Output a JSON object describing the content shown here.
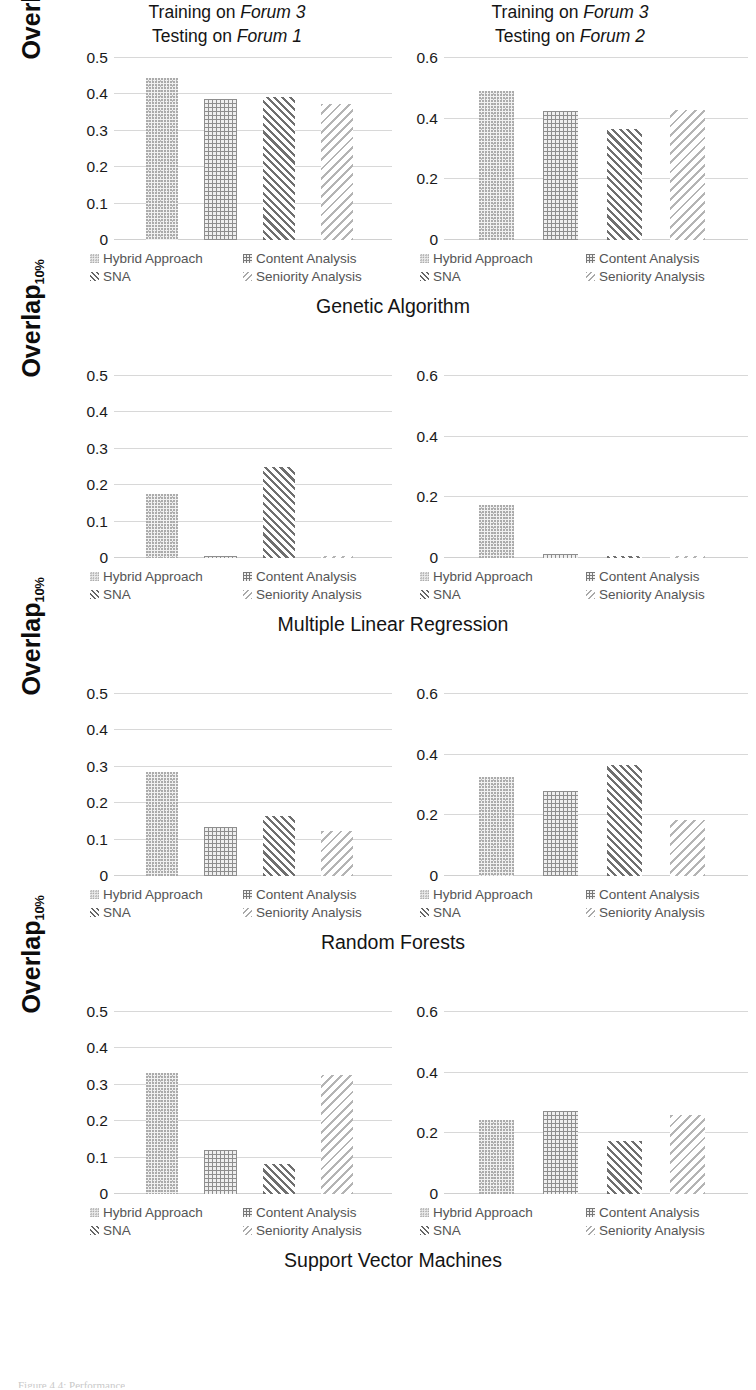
{
  "figure": {
    "ylabel_main": "Overlap",
    "ylabel_sub": "10%",
    "caption": "Figure 4.4: Performance"
  },
  "legend": {
    "hybrid": "Hybrid Approach",
    "content": "Content Analysis",
    "sna": "SNA",
    "seniority": "Seniority Analysis"
  },
  "titles": {
    "left_line1_pre": "Training on ",
    "left_line1_em": "Forum 3",
    "left_line2_pre": "Testing on ",
    "left_line2_em": "Forum 1",
    "right_line1_pre": "Training on ",
    "right_line1_em": "Forum 3",
    "right_line2_pre": "Testing on ",
    "right_line2_em": "Forum 2"
  },
  "ticks": {
    "left": [
      "0.5",
      "0.4",
      "0.3",
      "0.2",
      "0.1",
      "0"
    ],
    "right": [
      "0.6",
      "0.4",
      "0.2",
      "0"
    ]
  },
  "rows": [
    {
      "algorithm": "Genetic Algorithm"
    },
    {
      "algorithm": "Multiple Linear Regression"
    },
    {
      "algorithm": "Random Forests"
    },
    {
      "algorithm": "Support Vector Machines"
    }
  ],
  "chart_data": [
    {
      "type": "bar",
      "title": "Training on Forum 3 / Testing on Forum 1",
      "algorithm": "Genetic Algorithm",
      "xlabel": "Genetic Algorithm",
      "ylabel": "Overlap 10%",
      "ylim": [
        0,
        0.5
      ],
      "yticks": [
        0,
        0.1,
        0.2,
        0.3,
        0.4,
        0.5
      ],
      "grid": true,
      "legend_position": "bottom",
      "categories": [
        "Hybrid Approach",
        "Content Analysis",
        "SNA",
        "Seniority Analysis"
      ],
      "values": [
        0.445,
        0.388,
        0.392,
        0.375
      ]
    },
    {
      "type": "bar",
      "title": "Training on Forum 3 / Testing on Forum 2",
      "algorithm": "Genetic Algorithm",
      "xlabel": "Genetic Algorithm",
      "ylabel": "Overlap 10%",
      "ylim": [
        0,
        0.6
      ],
      "yticks": [
        0,
        0.2,
        0.4,
        0.6
      ],
      "grid": true,
      "legend_position": "bottom",
      "categories": [
        "Hybrid Approach",
        "Content Analysis",
        "SNA",
        "Seniority Analysis"
      ],
      "values": [
        0.49,
        0.425,
        0.365,
        0.43
      ]
    },
    {
      "type": "bar",
      "title": "Training on Forum 3 / Testing on Forum 1",
      "algorithm": "Multiple Linear Regression",
      "xlabel": "Multiple Linear Regression",
      "ylabel": "Overlap 10%",
      "ylim": [
        0,
        0.5
      ],
      "yticks": [
        0,
        0.1,
        0.2,
        0.3,
        0.4,
        0.5
      ],
      "grid": true,
      "legend_position": "bottom",
      "categories": [
        "Hybrid Approach",
        "Content Analysis",
        "SNA",
        "Seniority Analysis"
      ],
      "values": [
        0.175,
        0.006,
        0.25,
        0.003
      ]
    },
    {
      "type": "bar",
      "title": "Training on Forum 3 / Testing on Forum 2",
      "algorithm": "Multiple Linear Regression",
      "xlabel": "Multiple Linear Regression",
      "ylabel": "Overlap 10%",
      "ylim": [
        0,
        0.6
      ],
      "yticks": [
        0,
        0.2,
        0.4,
        0.6
      ],
      "grid": true,
      "legend_position": "bottom",
      "categories": [
        "Hybrid Approach",
        "Content Analysis",
        "SNA",
        "Seniority Analysis"
      ],
      "values": [
        0.175,
        0.012,
        0.005,
        0.008
      ]
    },
    {
      "type": "bar",
      "title": "Training on Forum 3 / Testing on Forum 1",
      "algorithm": "Random Forests",
      "xlabel": "Random Forests",
      "ylabel": "Overlap 10%",
      "ylim": [
        0,
        0.5
      ],
      "yticks": [
        0,
        0.1,
        0.2,
        0.3,
        0.4,
        0.5
      ],
      "grid": true,
      "legend_position": "bottom",
      "categories": [
        "Hybrid Approach",
        "Content Analysis",
        "SNA",
        "Seniority Analysis"
      ],
      "values": [
        0.285,
        0.135,
        0.165,
        0.125
      ]
    },
    {
      "type": "bar",
      "title": "Training on Forum 3 / Testing on Forum 2",
      "algorithm": "Random Forests",
      "xlabel": "Random Forests",
      "ylabel": "Overlap 10%",
      "ylim": [
        0,
        0.6
      ],
      "yticks": [
        0,
        0.2,
        0.4,
        0.6
      ],
      "grid": true,
      "legend_position": "bottom",
      "categories": [
        "Hybrid Approach",
        "Content Analysis",
        "SNA",
        "Seniority Analysis"
      ],
      "values": [
        0.325,
        0.28,
        0.365,
        0.185
      ]
    },
    {
      "type": "bar",
      "title": "Training on Forum 3 / Testing on Forum 1",
      "algorithm": "Support Vector Machines",
      "xlabel": "Support Vector Machines",
      "ylabel": "Overlap 10%",
      "ylim": [
        0,
        0.5
      ],
      "yticks": [
        0,
        0.1,
        0.2,
        0.3,
        0.4,
        0.5
      ],
      "grid": true,
      "legend_position": "bottom",
      "categories": [
        "Hybrid Approach",
        "Content Analysis",
        "SNA",
        "Seniority Analysis"
      ],
      "values": [
        0.332,
        0.122,
        0.082,
        0.327
      ]
    },
    {
      "type": "bar",
      "title": "Training on Forum 3 / Testing on Forum 2",
      "algorithm": "Support Vector Machines",
      "xlabel": "Support Vector Machines",
      "ylabel": "Overlap 10%",
      "ylim": [
        0,
        0.6
      ],
      "yticks": [
        0,
        0.2,
        0.4,
        0.6
      ],
      "grid": true,
      "legend_position": "bottom",
      "categories": [
        "Hybrid Approach",
        "Content Analysis",
        "SNA",
        "Seniority Analysis"
      ],
      "values": [
        0.245,
        0.275,
        0.175,
        0.26
      ]
    }
  ]
}
